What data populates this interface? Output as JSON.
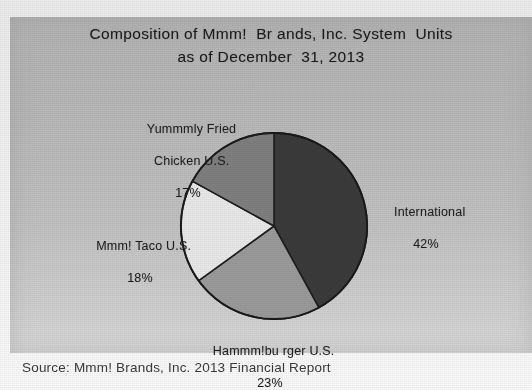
{
  "figure": {
    "title_line1": "Composition of Mmm!  Br ands, Inc. System  Units",
    "title_line2": "as of December  31, 2013",
    "source": "Source: Mmm! Brands, Inc. 2013 Financial Report",
    "panel_color": "#bdbdbd",
    "page_color": "#f1f1f1"
  },
  "chart_data": {
    "type": "pie",
    "title": "Composition of Mmm!  Br ands, Inc. System  Units as of December  31, 2013",
    "xlabel": "",
    "ylabel": "",
    "grid": false,
    "legend_position": "none",
    "labels_position": "outside-callout",
    "start_angle_deg": 0,
    "direction": "clockwise",
    "units": "percent",
    "total": 100,
    "categories": [
      "International",
      "Hammm!bu rger U.S.",
      "Mmm! Taco U.S.",
      "Yummmly Fried Chicken U.S."
    ],
    "values": [
      42,
      23,
      18,
      17
    ],
    "slices": [
      {
        "name": "International",
        "label_line1": "International",
        "label_pct": "42%",
        "value": 42,
        "color": "#3b3b3b",
        "start_deg": 0,
        "end_deg": 151.2
      },
      {
        "name": "Hammm!bu rger U.S.",
        "label_line1": "Hammm!bu rger U.S.",
        "label_pct": "23%",
        "value": 23,
        "color": "#9b9b9b",
        "start_deg": 151.2,
        "end_deg": 234.0
      },
      {
        "name": "Mmm! Taco U.S.",
        "label_line1": "Mmm! Taco U.S.",
        "label_pct": "18%",
        "value": 18,
        "color": "#e9e9e9",
        "start_deg": 234.0,
        "end_deg": 298.8
      },
      {
        "name": "Yummmly Fried Chicken U.S.",
        "label_line1": "Yummmly Fried",
        "label_line2": "Chicken U.S.",
        "label_pct": "17%",
        "value": 17,
        "color": "#7f7f7f",
        "start_deg": 298.8,
        "end_deg": 360.0
      }
    ]
  }
}
